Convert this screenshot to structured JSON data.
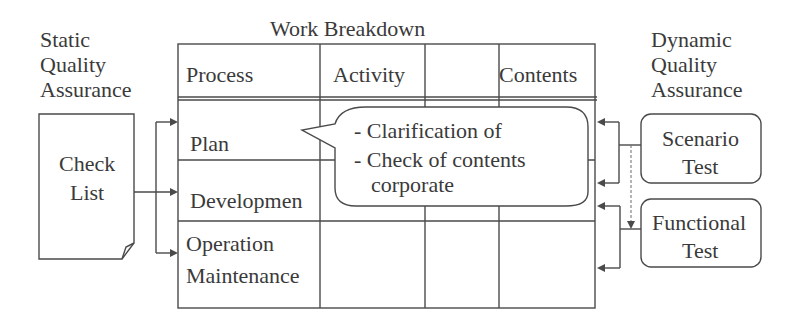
{
  "static_qa": {
    "line1": "Static",
    "line2": "Quality",
    "line3": "Assurance"
  },
  "dynamic_qa": {
    "line1": "Dynamic",
    "line2": "Quality",
    "line3": "Assurance"
  },
  "work_breakdown": {
    "title": "Work Breakdown",
    "headers": [
      "Process",
      "Activity",
      "",
      "Contents"
    ],
    "rows": [
      {
        "process": "Plan"
      },
      {
        "process": "Developmen"
      },
      {
        "process_line1": "Operation",
        "process_line2": "Maintenance"
      }
    ]
  },
  "check_list": {
    "line1": "Check",
    "line2": "List"
  },
  "callout": {
    "line1": "- Clarification of",
    "line2": "- Check of contents",
    "line3": "corporate"
  },
  "scenario_test": {
    "line1": "Scenario",
    "line2": "Test"
  },
  "functional_test": {
    "line1": "Functional",
    "line2": "Test"
  },
  "colors": {
    "line": "#4a4a4a",
    "text": "#3a3a3a",
    "background": "#ffffff"
  }
}
